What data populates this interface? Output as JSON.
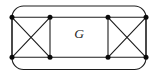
{
  "figure": {
    "label": "G",
    "label_position": {
      "x": 79,
      "y": 33.5
    },
    "canvas": {
      "width": 158,
      "height": 78
    },
    "colors": {
      "background": "#ffffff",
      "stroke": "#1c1c1c",
      "vertex_fill": "#0a0a0a"
    },
    "stroke_width": 1.1,
    "vertex_radius": 2.5,
    "outer_boundary": {
      "type": "rounded-rect",
      "x": 12,
      "y": 6,
      "width": 134,
      "height": 63.5,
      "radius": 11.5
    },
    "vertices": [
      {
        "id": "tl",
        "x": 12,
        "y": 17.3
      },
      {
        "id": "tml",
        "x": 50,
        "y": 17.3
      },
      {
        "id": "tmr",
        "x": 108,
        "y": 17.3
      },
      {
        "id": "tr",
        "x": 146,
        "y": 17.3
      },
      {
        "id": "bl",
        "x": 12,
        "y": 57.3
      },
      {
        "id": "bml",
        "x": 50,
        "y": 57.3
      },
      {
        "id": "bmr",
        "x": 108,
        "y": 57.3
      },
      {
        "id": "br",
        "x": 146,
        "y": 57.3
      }
    ],
    "edges": [
      [
        "tl",
        "tml"
      ],
      [
        "tml",
        "tmr"
      ],
      [
        "tmr",
        "tr"
      ],
      [
        "bl",
        "bml"
      ],
      [
        "bml",
        "bmr"
      ],
      [
        "bmr",
        "br"
      ],
      [
        "tl",
        "bl"
      ],
      [
        "tml",
        "bml"
      ],
      [
        "tmr",
        "bmr"
      ],
      [
        "tr",
        "br"
      ],
      [
        "tl",
        "bml"
      ],
      [
        "tml",
        "bl"
      ],
      [
        "tmr",
        "br"
      ],
      [
        "tr",
        "bmr"
      ]
    ]
  }
}
